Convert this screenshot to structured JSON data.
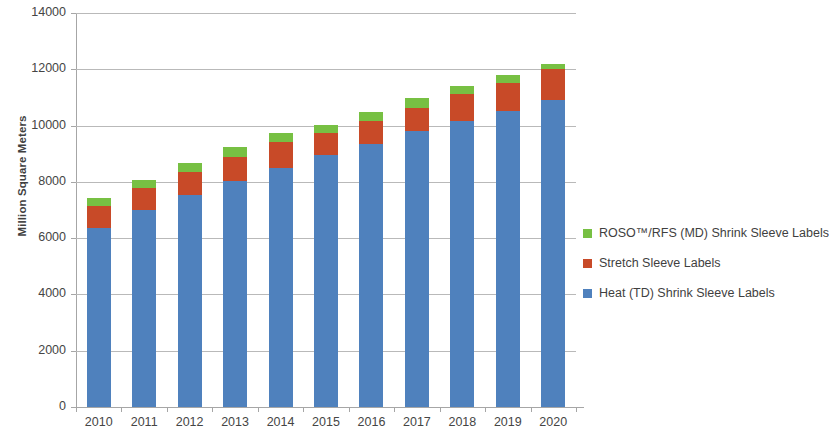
{
  "chart_data": {
    "type": "bar",
    "subtype": "stacked-column",
    "title": "",
    "xlabel": "",
    "ylabel": "Million Square Meters",
    "ylim": [
      0,
      14000
    ],
    "ytick_step": 2000,
    "yticks": [
      "14000",
      "12000",
      "10000",
      "8000",
      "6000",
      "4000",
      "2000",
      "0"
    ],
    "grid": true,
    "legend_position": "right",
    "categories": [
      "2010",
      "2011",
      "2012",
      "2013",
      "2014",
      "2015",
      "2016",
      "2017",
      "2018",
      "2019",
      "2020"
    ],
    "series": [
      {
        "name": "Heat (TD) Shrink Sleeve Labels",
        "color": "#4f81bd",
        "values": [
          6350,
          7000,
          7530,
          8030,
          8500,
          8940,
          9330,
          9800,
          10150,
          10530,
          10900
        ]
      },
      {
        "name": "Stretch Sleeve Labels",
        "color": "#c84a28",
        "values": [
          800,
          800,
          830,
          870,
          900,
          780,
          820,
          840,
          990,
          1000,
          1100
        ]
      },
      {
        "name": "ROSO™/RFS (MD) Shrink Sleeve Labels",
        "color": "#77c043",
        "values": [
          280,
          280,
          300,
          330,
          350,
          310,
          330,
          330,
          260,
          260,
          180
        ]
      }
    ],
    "totals": [
      7430,
      8080,
      8660,
      9230,
      9750,
      10030,
      10480,
      10970,
      11400,
      11790,
      12180
    ]
  },
  "legend": {
    "entries": [
      {
        "label": "ROSO™/RFS (MD) Shrink Sleeve Labels",
        "color": "#77c043"
      },
      {
        "label": "Stretch Sleeve Labels",
        "color": "#c84a28"
      },
      {
        "label": "Heat (TD) Shrink Sleeve Labels",
        "color": "#4f81bd"
      }
    ]
  }
}
